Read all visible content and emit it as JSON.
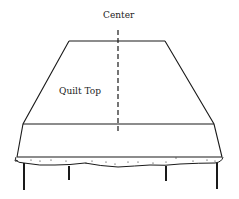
{
  "diagram": {
    "labels": {
      "center": "Center",
      "quilt_top": "Quilt Top"
    },
    "colors": {
      "line": "#1a1a1a",
      "background": "#ffffff"
    },
    "parts": [
      "quilt-top-trapezoid",
      "center-dashed-line",
      "table-edge",
      "table-skirt",
      "table-legs"
    ]
  }
}
